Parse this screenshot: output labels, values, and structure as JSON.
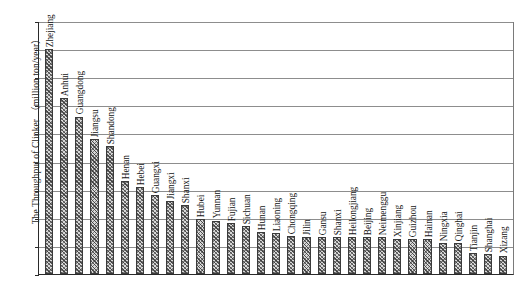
{
  "chart_data": {
    "type": "bar",
    "title": "",
    "xlabel": "",
    "ylabel": "The Throughput of Clinker （million ton/year）",
    "ylim": [
      0,
      90
    ],
    "ytick_step": 10,
    "yticks": [
      "90",
      "80",
      "70",
      "60",
      "50",
      "40",
      "30",
      "20",
      "10",
      "0"
    ],
    "grid": true,
    "legend": "none",
    "orientation": "vertical",
    "categories": [
      "Zhejiang",
      "Anhui",
      "Guangdong",
      "Jiangsu",
      "Shandong",
      "Henan",
      "Hebei",
      "Guangxi",
      "Jiangxi",
      "Shanxi",
      "Hubei",
      "Yunnan",
      "Fujian",
      "Sichuan",
      "Hunan",
      "Liaoning",
      "Chongqing",
      "Jilin",
      "Gansu",
      "Shanxi",
      "Heilongjiang",
      "Beijing",
      "Neimenggu",
      "Xinjiang",
      "Guizhou",
      "Hainan",
      "Ningxia",
      "Qinghai",
      "Tianjin",
      "Shanghai",
      "Xizang"
    ],
    "values": [
      80,
      62.5,
      56,
      48,
      45.5,
      33,
      31,
      28,
      26,
      24.5,
      19.5,
      19,
      18,
      17,
      15,
      14.5,
      13.5,
      13,
      13,
      13,
      13,
      13,
      13,
      12.5,
      12.5,
      12.5,
      11,
      11,
      7.5,
      7,
      6.5
    ]
  }
}
